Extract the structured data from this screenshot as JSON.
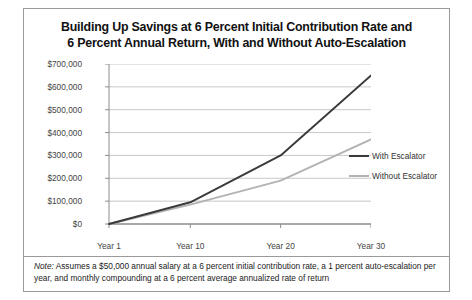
{
  "figure": {
    "title_line1": "Building Up Savings at 6 Percent Initial Contribution Rate and",
    "title_line2": "6 Percent Annual Return, With and Without Auto-Escalation",
    "note_label": "Note:",
    "note_text": " Assumes a $50,000 annual salary at a 6 percent initial contribution rate, a 1 percent auto-escalation per year, and monthly compounding at a 6 percent average annualized rate of return"
  },
  "colors": {
    "with_escalator": "#3a3a3a",
    "without_escalator": "#b3b3b3",
    "grid": "#c8c8c8",
    "axis": "#8c8c8c",
    "border": "#9a9a9a",
    "text": "#444444"
  },
  "chart_data": {
    "type": "line",
    "title": "Building Up Savings at 6 Percent Initial Contribution Rate and 6 Percent Annual Return, With and Without Auto-Escalation",
    "xlabel": "",
    "ylabel": "",
    "x": [
      1,
      10,
      20,
      30
    ],
    "categories": [
      "Year 1",
      "Year 10",
      "Year 20",
      "Year 30"
    ],
    "xtick_labels": [
      "Year 1",
      "Year 10",
      "Year 20",
      "Year 30"
    ],
    "ytick_labels": [
      "$0",
      "$100,000",
      "$200,000",
      "$300,000",
      "$400,000",
      "$500,000",
      "$600,000",
      "$700,000"
    ],
    "ytick_values": [
      0,
      100000,
      200000,
      300000,
      400000,
      500000,
      600000,
      700000
    ],
    "ylim": [
      0,
      700000
    ],
    "xlim": [
      1,
      30
    ],
    "grid": true,
    "legend_position": "right",
    "series": [
      {
        "name": "With Escalator",
        "color": "#3a3a3a",
        "values": [
          0,
          95000,
          300000,
          650000
        ],
        "points": [
          {
            "x": 1,
            "y": 0
          },
          {
            "x": 10,
            "y": 95000
          },
          {
            "x": 20,
            "y": 300000
          },
          {
            "x": 30,
            "y": 650000
          }
        ]
      },
      {
        "name": "Without Escalator",
        "color": "#b3b3b3",
        "values": [
          0,
          85000,
          190000,
          370000
        ],
        "points": [
          {
            "x": 1,
            "y": 0
          },
          {
            "x": 10,
            "y": 85000
          },
          {
            "x": 20,
            "y": 190000
          },
          {
            "x": 30,
            "y": 370000
          }
        ]
      }
    ]
  }
}
